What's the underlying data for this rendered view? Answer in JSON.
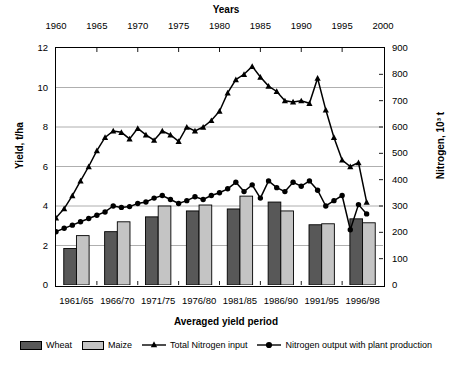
{
  "chart_data": {
    "type": "bar",
    "title": "",
    "top_axis": {
      "label": "Years",
      "ticks": [
        1960,
        1965,
        1970,
        1975,
        1980,
        1985,
        1990,
        1995,
        2000
      ],
      "range": [
        1960,
        2000
      ]
    },
    "xlabel": "Averaged yield period",
    "categories": [
      "1961/65",
      "1966/70",
      "1971/75",
      "1976/80",
      "1981/85",
      "1986/90",
      "1991/95",
      "1996/98"
    ],
    "ylabel": "Yield, t/ha",
    "ylim": [
      0,
      12
    ],
    "yticks": [
      0,
      2,
      4,
      6,
      8,
      10,
      12
    ],
    "y2label": "Nitrogen, 10³ t",
    "y2lim": [
      0,
      900
    ],
    "y2ticks": [
      0,
      100,
      200,
      300,
      400,
      500,
      600,
      700,
      800,
      900
    ],
    "grid": true,
    "legend_position": "bottom",
    "series": [
      {
        "name": "Wheat",
        "type": "bar",
        "axis": "left",
        "color": "#585858",
        "categories": [
          "1961/65",
          "1966/70",
          "1971/75",
          "1976/80",
          "1981/85",
          "1986/90",
          "1991/95",
          "1996/98"
        ],
        "values": [
          1.85,
          2.7,
          3.45,
          3.75,
          3.85,
          4.2,
          3.05,
          3.35
        ]
      },
      {
        "name": "Maize",
        "type": "bar",
        "axis": "left",
        "color": "#c4c4c4",
        "categories": [
          "1961/65",
          "1966/70",
          "1971/75",
          "1976/80",
          "1981/85",
          "1986/90",
          "1991/95",
          "1996/98"
        ],
        "values": [
          2.5,
          3.2,
          4.0,
          4.05,
          4.5,
          3.75,
          3.1,
          3.15
        ]
      },
      {
        "name": "Total Nitrogen input",
        "type": "line",
        "marker": "triangle",
        "axis": "right",
        "color": "#000000",
        "x": [
          1960,
          1961,
          1962,
          1963,
          1964,
          1965,
          1966,
          1967,
          1968,
          1969,
          1970,
          1971,
          1972,
          1973,
          1974,
          1975,
          1976,
          1977,
          1978,
          1979,
          1980,
          1981,
          1982,
          1983,
          1984,
          1985,
          1986,
          1987,
          1988,
          1989,
          1990,
          1991,
          1992,
          1993,
          1994,
          1995,
          1996,
          1997,
          1998
        ],
        "values_nitrogen": [
          255,
          290,
          340,
          395,
          450,
          510,
          560,
          585,
          580,
          555,
          595,
          570,
          550,
          585,
          570,
          545,
          600,
          585,
          600,
          625,
          660,
          730,
          780,
          800,
          830,
          790,
          755,
          735,
          700,
          695,
          700,
          690,
          785,
          665,
          560,
          475,
          450,
          465,
          455
        ],
        "values_yield_scale": [
          3.4,
          3.87,
          4.53,
          5.27,
          6.0,
          6.8,
          7.47,
          7.8,
          7.73,
          7.4,
          7.93,
          7.6,
          7.33,
          7.8,
          7.6,
          7.27,
          8.0,
          7.8,
          8.0,
          8.33,
          8.8,
          9.73,
          10.4,
          10.67,
          11.07,
          10.53,
          10.07,
          9.8,
          9.33,
          9.27,
          9.33,
          9.2,
          10.47,
          8.87,
          7.47,
          6.33,
          6.0,
          6.2,
          4.2
        ]
      },
      {
        "name": "Nitrogen output with plant production",
        "type": "line",
        "marker": "circle",
        "axis": "right",
        "color": "#000000",
        "x": [
          1960,
          1961,
          1962,
          1963,
          1964,
          1965,
          1966,
          1967,
          1968,
          1969,
          1970,
          1971,
          1972,
          1973,
          1974,
          1975,
          1976,
          1977,
          1978,
          1979,
          1980,
          1981,
          1982,
          1983,
          1984,
          1985,
          1986,
          1987,
          1988,
          1989,
          1990,
          1991,
          1992,
          1993,
          1994,
          1995,
          1996,
          1997,
          1998
        ],
        "values_nitrogen": [
          203,
          215,
          228,
          240,
          253,
          265,
          278,
          300,
          295,
          298,
          310,
          315,
          330,
          340,
          325,
          310,
          320,
          335,
          325,
          340,
          350,
          365,
          390,
          355,
          380,
          330,
          395,
          370,
          355,
          390,
          375,
          395,
          360,
          300,
          320,
          340,
          210,
          305,
          270
        ],
        "values_yield_scale": [
          2.7,
          2.87,
          3.03,
          3.2,
          3.37,
          3.53,
          3.7,
          4.0,
          3.93,
          3.97,
          4.13,
          4.2,
          4.4,
          4.53,
          4.33,
          4.13,
          4.27,
          4.47,
          4.33,
          4.53,
          4.67,
          4.87,
          5.2,
          4.73,
          5.07,
          4.4,
          5.27,
          4.93,
          4.73,
          5.2,
          5.0,
          5.27,
          4.8,
          4.0,
          4.27,
          4.53,
          2.8,
          4.07,
          3.6
        ]
      }
    ]
  },
  "labels": {
    "years_title": "Years",
    "yield_axis": "Yield, t/ha",
    "nitrogen_axis": "Nitrogen, 10³ t",
    "x_axis_title": "Averaged yield period",
    "legend": {
      "wheat": "Wheat",
      "maize": "Maize",
      "nitrogen_input": "Total Nitrogen input",
      "nitrogen_output": "Nitrogen output with plant production"
    }
  }
}
